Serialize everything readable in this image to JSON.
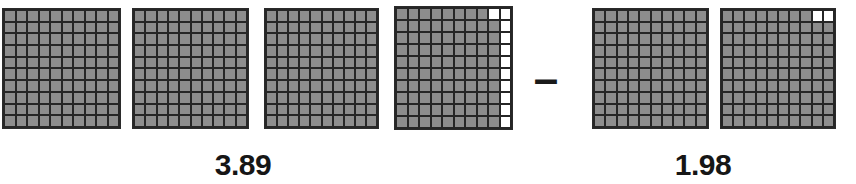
{
  "figure": {
    "type": "decimal-grid-subtraction-model",
    "background_color": "#ffffff",
    "filled_cell_color": "#8d8d8d",
    "empty_cell_color": "#ffffff",
    "gridline_color": "#262626",
    "text_color": "#161616"
  },
  "operator": {
    "symbol": "–",
    "name": "minus-sign"
  },
  "minuend": {
    "label": "3.89",
    "whole_grids": 3,
    "partial_grid_filled_cells": 89,
    "partial_grid_empty_cells": 11
  },
  "subtrahend": {
    "label": "1.98",
    "whole_grids": 1,
    "partial_grid_filled_cells": 98,
    "partial_grid_empty_cells": 2
  },
  "grids": [
    {
      "id": "minuend-grid-1",
      "group": "minuend",
      "filled": 100,
      "empty_cells": []
    },
    {
      "id": "minuend-grid-2",
      "group": "minuend",
      "filled": 100,
      "empty_cells": []
    },
    {
      "id": "minuend-grid-3",
      "group": "minuend",
      "filled": 100,
      "empty_cells": []
    },
    {
      "id": "minuend-grid-4",
      "group": "minuend",
      "filled": 89,
      "empty_cells": [
        8,
        9,
        19,
        29,
        39,
        49,
        59,
        69,
        79,
        89,
        99
      ]
    },
    {
      "id": "subtrahend-grid-1",
      "group": "subtrahend",
      "filled": 100,
      "empty_cells": []
    },
    {
      "id": "subtrahend-grid-2",
      "group": "subtrahend",
      "filled": 98,
      "empty_cells": [
        8,
        9
      ]
    }
  ],
  "layout": {
    "grid_positions": [
      {
        "x": 2,
        "y": 8,
        "w": 119,
        "h": 121
      },
      {
        "x": 132,
        "y": 8,
        "w": 117,
        "h": 121
      },
      {
        "x": 264,
        "y": 8,
        "w": 115,
        "h": 121
      },
      {
        "x": 394,
        "y": 6,
        "w": 119,
        "h": 124
      },
      {
        "x": 592,
        "y": 8,
        "w": 117,
        "h": 121
      },
      {
        "x": 720,
        "y": 8,
        "w": 116,
        "h": 121
      }
    ],
    "operator_position": {
      "x": 531,
      "y": 57,
      "w": 30,
      "h": 30,
      "font_size": 44
    },
    "label_positions": [
      {
        "x": 183,
        "y": 150,
        "w": 120
      },
      {
        "x": 643,
        "y": 150,
        "w": 120
      }
    ]
  }
}
